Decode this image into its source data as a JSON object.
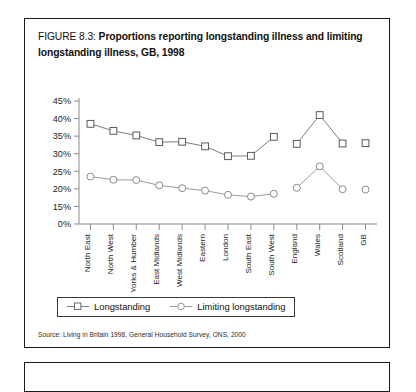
{
  "figure": {
    "label": "FIGURE 8.3:",
    "title": "Proportions reporting longstanding illness and limiting longstanding illness, GB, 1998",
    "title_line1": "Proportions reporting longstanding illness and",
    "title_line2": "limiting longstanding illness, GB, 1998",
    "source": "Source: Living in Britain 1998, General Household Survey, ONS, 2000"
  },
  "legend": {
    "entries": [
      {
        "label": "Longstanding",
        "marker": "square-open-marker"
      },
      {
        "label": "Limiting longstanding",
        "marker": "circle-open-marker"
      }
    ]
  },
  "chart_data": {
    "type": "line",
    "title": "Proportions reporting longstanding illness and limiting longstanding illness, GB, 1998",
    "xlabel": "",
    "ylabel": "",
    "grid": false,
    "legend_position": "bottom-left",
    "ytick_labels": [
      "45%",
      "40%",
      "35%",
      "30%",
      "25%",
      "20%",
      "15%",
      "0%"
    ],
    "ytick_values": [
      45,
      40,
      35,
      30,
      25,
      20,
      15,
      0
    ],
    "ylim": [
      0,
      45
    ],
    "categories": [
      "North East",
      "North West",
      "Yorks & Humber",
      "East Midlands",
      "West Midlands",
      "Eastern",
      "London",
      "South East",
      "South West",
      "England",
      "Wales",
      "Scotland",
      "GB"
    ],
    "series": [
      {
        "name": "Longstanding",
        "marker": "square-open",
        "values": [
          38.5,
          36.5,
          35.2,
          33.3,
          33.4,
          32.1,
          29.3,
          29.4,
          34.8,
          32.8,
          41.0,
          32.9,
          33.0
        ]
      },
      {
        "name": "Limiting longstanding",
        "marker": "circle-open",
        "values": [
          23.5,
          22.6,
          22.5,
          21.0,
          20.2,
          19.5,
          18.3,
          17.8,
          18.6,
          20.3,
          26.4,
          19.9,
          19.8
        ]
      }
    ],
    "segment_breaks": [
      9,
      12
    ]
  },
  "colors": {
    "line": "#6e6e6e",
    "marker_stroke": "#5a5a5a",
    "axis": "#8a8a8a",
    "text": "#1d1d1d",
    "border": "#1a1a1a"
  }
}
